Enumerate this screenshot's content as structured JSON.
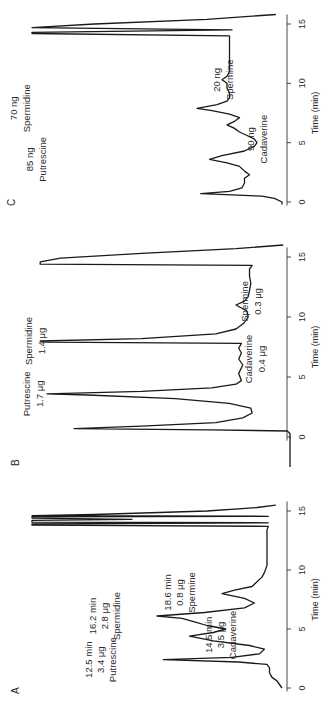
{
  "chart_data": [
    {
      "type": "line",
      "panel": "A",
      "xlabel": "Time (min)",
      "ylabel": "",
      "xlim": [
        0,
        15
      ],
      "xticks": [
        0,
        5,
        10,
        15
      ],
      "orientation": "rotated-90-ccw",
      "series": [
        {
          "name": "chromatogram",
          "x": [
            0,
            0.3,
            0.6,
            0.9,
            1.3,
            1.7,
            2.0,
            2.2,
            2.4,
            2.6,
            2.9,
            3.3,
            3.6,
            4.0,
            4.4,
            4.7,
            5.0,
            5.3,
            5.6,
            5.9,
            6.1,
            6.4,
            6.8,
            7.2,
            7.6,
            8.0,
            8.3,
            8.6,
            9.0,
            9.4,
            9.8,
            10.4,
            11.2,
            12.0,
            12.8,
            13.4,
            13.7,
            13.8,
            13.9,
            14.0,
            14.05,
            14.2,
            14.3,
            14.4,
            14.5,
            14.55,
            14.6,
            14.7,
            15.0,
            15.3,
            15.5
          ],
          "y": [
            0,
            2,
            4,
            8,
            10,
            10,
            12,
            35,
            95,
            40,
            18,
            14,
            26,
            55,
            74,
            55,
            45,
            60,
            70,
            80,
            100,
            62,
            30,
            22,
            30,
            48,
            38,
            24,
            20,
            16,
            14,
            12,
            12,
            12,
            12,
            12,
            11,
            200,
            200,
            11,
            200,
            200,
            120,
            200,
            200,
            11,
            200,
            150,
            60,
            20,
            5
          ]
        }
      ],
      "annotations": [
        {
          "time": 2.4,
          "lines": [
            "12.5 min",
            "3.4 μg",
            "Putrescine"
          ],
          "side": "left"
        },
        {
          "time": 6.1,
          "lines": [
            "16.2 min",
            "2.8 μg",
            "Spermidine"
          ],
          "side": "left"
        },
        {
          "time": 4.5,
          "lines": [
            "14.5 min",
            "3.5 μg",
            "Cadaverine"
          ],
          "side": "right"
        },
        {
          "time": 8.1,
          "lines": [
            "18.6 min",
            "0.8 μg",
            "Spermine"
          ],
          "side": "left"
        }
      ]
    },
    {
      "type": "line",
      "panel": "B",
      "xlabel": "Time (min)",
      "ylabel": "",
      "xlim": [
        0,
        15
      ],
      "xticks": [
        0,
        5,
        10,
        15
      ],
      "orientation": "rotated-90-ccw",
      "series": [
        {
          "name": "chromatogram",
          "x": [
            -2.5,
            -1,
            0,
            0.3,
            0.5,
            0.6,
            0.7,
            0.9,
            1.2,
            1.6,
            2.0,
            2.4,
            2.8,
            3.2,
            3.5,
            3.6,
            3.8,
            4.1,
            4.4,
            4.7,
            5.3,
            6.0,
            6.5,
            7.0,
            7.4,
            7.8,
            7.9,
            8.0,
            8.2,
            8.6,
            9.0,
            9.5,
            10.0,
            10.5,
            11.0,
            11.3,
            11.7,
            12.2,
            12.8,
            13.4,
            14.0,
            14.3,
            14.4,
            14.5,
            14.6,
            14.9,
            15.3,
            15.7,
            16.0
          ],
          "y": [
            0,
            0,
            0,
            0,
            2,
            60,
            160,
            110,
            55,
            35,
            28,
            29,
            45,
            85,
            150,
            180,
            110,
            58,
            40,
            36,
            38,
            35,
            38,
            36,
            38,
            36,
            180,
            185,
            110,
            55,
            40,
            34,
            31,
            32,
            40,
            34,
            31,
            30,
            29,
            30,
            30,
            28,
            185,
            185,
            185,
            170,
            110,
            40,
            5
          ]
        }
      ],
      "annotations": [
        {
          "time": 3.6,
          "lines": [
            "Putrescine",
            "1.7 μg"
          ],
          "side": "left"
        },
        {
          "time": 8.0,
          "lines": [
            "Spermidine",
            "1.4 μg"
          ],
          "side": "left"
        },
        {
          "time": 6.5,
          "lines": [
            "Cadaverine",
            "0.4 μg"
          ],
          "side": "right"
        },
        {
          "time": 11.3,
          "lines": [
            "Spermine",
            "0.3 μg"
          ],
          "side": "right"
        }
      ]
    },
    {
      "type": "line",
      "panel": "C",
      "xlabel": "Time (min)",
      "ylabel": "",
      "xlim": [
        0,
        15
      ],
      "xticks": [
        0,
        5,
        10,
        15
      ],
      "orientation": "rotated-90-ccw",
      "series": [
        {
          "name": "chromatogram",
          "x": [
            -0.2,
            0,
            0.3,
            0.5,
            0.6,
            0.7,
            0.9,
            1.2,
            1.6,
            2.0,
            2.3,
            2.6,
            3.0,
            3.3,
            3.6,
            3.9,
            4.3,
            4.7,
            5.0,
            5.3,
            5.6,
            5.9,
            6.2,
            6.5,
            6.8,
            7.1,
            7.4,
            7.7,
            7.9,
            8.2,
            8.5,
            8.8,
            9.2,
            9.6,
            10.0,
            10.3,
            10.6,
            11.0,
            11.5,
            12.0,
            12.5,
            13.0,
            13.5,
            13.8,
            14.0,
            14.2,
            14.3,
            14.5,
            14.7,
            15.0,
            15.4,
            15.8
          ],
          "y": [
            0,
            0,
            6,
            16,
            40,
            65,
            42,
            32,
            30,
            30,
            26,
            30,
            34,
            44,
            58,
            48,
            30,
            22,
            20,
            22,
            28,
            34,
            38,
            44,
            38,
            34,
            42,
            56,
            68,
            52,
            44,
            42,
            42,
            44,
            44,
            48,
            44,
            42,
            42,
            42,
            42,
            42,
            42,
            42,
            42,
            200,
            200,
            40,
            200,
            150,
            60,
            5
          ]
        }
      ],
      "annotations": [
        {
          "time": 3.6,
          "lines": [
            "85 ng",
            "Putrescine"
          ],
          "side": "left"
        },
        {
          "time": 7.9,
          "lines": [
            "70 ng",
            "Spermidine"
          ],
          "side": "left"
        },
        {
          "time": 5.3,
          "lines": [
            "90 ng",
            "Cadaverine"
          ],
          "side": "right"
        },
        {
          "time": 10.3,
          "lines": [
            "20 ng",
            "Spermine"
          ],
          "side": "right"
        }
      ]
    }
  ]
}
